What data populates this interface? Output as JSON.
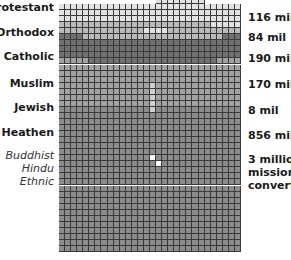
{
  "chart_data": {
    "type": "waffle",
    "title": "",
    "grid": {
      "columns": 30,
      "rows": 41
    },
    "categories": [
      "Protestant",
      "Orthodox",
      "Catholic",
      "Muslim",
      "Jewish",
      "Heathen",
      "Buddhist / Hindu / Ethnic (mission converts)"
    ],
    "values_millions": [
      116,
      84,
      190,
      170,
      8,
      856,
      3
    ],
    "value_labels": [
      "116 mil",
      "84 mil",
      "190 mil",
      "170 mil",
      "8 mil",
      "856 mil",
      "3 million mission converts"
    ],
    "colors": {
      "Protestant": "#e2e2e2",
      "Orthodox": "#b9b9b9",
      "Catholic": "#707070",
      "Muslim": "#a2a2a2",
      "Jewish": "#cfcfcf",
      "Heathen": "#8c8c8c",
      "Converts": "#ffffff"
    },
    "legend_position": "left-and-right labels"
  },
  "labels_left": [
    {
      "text": "Protestant",
      "style": "bold"
    },
    {
      "text": "Orthodox",
      "style": "bold"
    },
    {
      "text": "Catholic",
      "style": "bold"
    },
    {
      "text": "Muslim",
      "style": "bold"
    },
    {
      "text": "Jewish",
      "style": "bold"
    },
    {
      "text": "Heathen",
      "style": "bold"
    },
    {
      "text": "Buddhist",
      "style": "italic"
    },
    {
      "text": "Hindu",
      "style": "italic"
    },
    {
      "text": "Ethnic",
      "style": "italic"
    }
  ],
  "labels_right": [
    {
      "text": "116 mil"
    },
    {
      "text": "84 mil"
    },
    {
      "text": "190 mil"
    },
    {
      "text": "170 mil"
    },
    {
      "text": "8 mil"
    },
    {
      "text": "856 mil"
    },
    {
      "text": "3 million"
    },
    {
      "text": "mission"
    },
    {
      "text": "converts"
    }
  ]
}
